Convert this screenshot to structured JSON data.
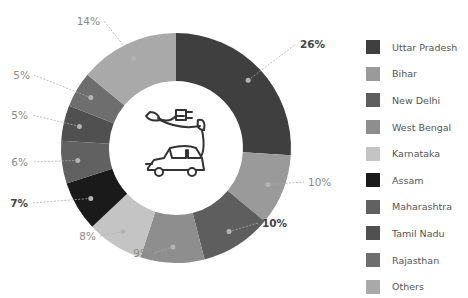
{
  "chart_data": {
    "type": "pie",
    "variant": "donut",
    "title": "",
    "start_angle": "top",
    "direction": "clockwise",
    "categories": [
      "Uttar Pradesh",
      "Bihar",
      "New Delhi",
      "West Bengal",
      "Karnataka",
      "Assam",
      "Maharashtra",
      "Tamil Nadu",
      "Rajasthan",
      "Others"
    ],
    "values": [
      26,
      10,
      10,
      9,
      8,
      7,
      6,
      5,
      5,
      14
    ],
    "labels": [
      "26%",
      "10%",
      "10%",
      "9%",
      "8%",
      "7%",
      "6%",
      "5%",
      "5%",
      "14%"
    ],
    "label_bold": [
      true,
      false,
      true,
      false,
      false,
      true,
      false,
      false,
      false,
      false
    ],
    "colors": [
      "#3f3f3f",
      "#9a9a9a",
      "#5e5e5e",
      "#8e8e8e",
      "#c4c4c4",
      "#1a1a1a",
      "#616161",
      "#505050",
      "#6e6e6e",
      "#a9a9a9"
    ],
    "legend_position": "right",
    "center_icon": "electric-car-icon"
  }
}
